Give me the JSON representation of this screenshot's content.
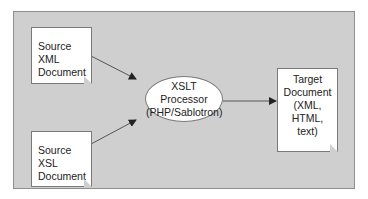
{
  "diagram": {
    "nodes": {
      "source_xml": {
        "label": [
          "Source",
          "XML",
          "Document"
        ]
      },
      "source_xsl": {
        "label": [
          "Source",
          "XSL",
          "Document"
        ]
      },
      "processor": {
        "label": [
          "XSLT",
          "Processor",
          "(PHP/Sablotron)"
        ]
      },
      "target": {
        "label": [
          "Target",
          "Document",
          "(XML,",
          "HTML,",
          "text)"
        ]
      }
    },
    "edges": [
      {
        "from": "source_xml",
        "to": "processor"
      },
      {
        "from": "source_xsl",
        "to": "processor"
      },
      {
        "from": "processor",
        "to": "target"
      }
    ],
    "colors": {
      "panel": "#cfcfcf",
      "border": "#7a7a7a",
      "node_fill": "#ffffff",
      "line": "#444444"
    }
  }
}
